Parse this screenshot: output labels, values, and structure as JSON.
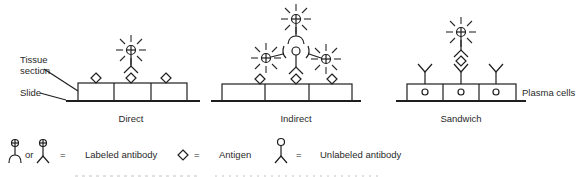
{
  "labels": {
    "tissue_section_line1": "Tissue",
    "tissue_section_line2": "section",
    "slide": "Slide",
    "plasma_cells": "Plasma cells"
  },
  "panels": [
    {
      "caption": "Direct"
    },
    {
      "caption": "Indirect"
    },
    {
      "caption": "Sandwich"
    }
  ],
  "legend": {
    "or": "or",
    "eq1": "=",
    "labeled_antibody": "Labeled antibody",
    "eq2": "=",
    "antigen": "Antigen",
    "eq3": "=",
    "unlabeled_antibody": "Unlabeled antibody"
  },
  "colors": {
    "ink": "#1e1e1e",
    "background": "#ffffff"
  }
}
